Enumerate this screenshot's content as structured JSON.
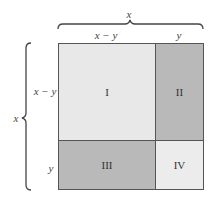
{
  "diagram": {
    "top_brace_label": "x",
    "left_brace_label": "x",
    "column_labels": [
      "x − y",
      "y"
    ],
    "row_labels": [
      "x − y",
      "y"
    ],
    "regions": [
      {
        "id": "I",
        "label": "I",
        "fill": "#e8e8e8"
      },
      {
        "id": "II",
        "label": "II",
        "fill": "#b9b9b9"
      },
      {
        "id": "III",
        "label": "III",
        "fill": "#b9b9b9"
      },
      {
        "id": "IV",
        "label": "IV",
        "fill": "#ececec"
      }
    ],
    "colors": {
      "border": "#555555",
      "brace": "#444444",
      "light_fill": "#e8e8e8",
      "dark_fill": "#b9b9b9"
    }
  }
}
